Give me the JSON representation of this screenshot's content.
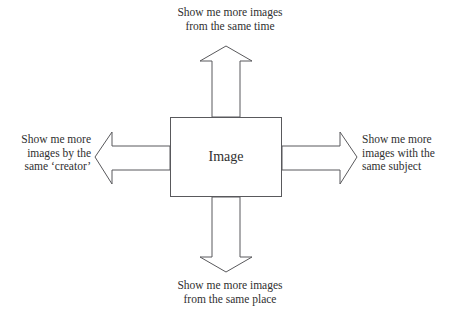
{
  "diagram": {
    "type": "radial-arrow-diagram",
    "center": {
      "label": "Image",
      "shape": "rectangle"
    },
    "branches": [
      {
        "direction": "up",
        "arrow_name": "arrow-up",
        "label": "Show me more images\nfrom the same time"
      },
      {
        "direction": "right",
        "arrow_name": "arrow-right",
        "label": "Show me more\nimages with the\nsame subject"
      },
      {
        "direction": "down",
        "arrow_name": "arrow-down",
        "label": "Show me more images\nfrom the same place"
      },
      {
        "direction": "left",
        "arrow_name": "arrow-left",
        "label": "Show me more\nimages by the\nsame ‘creator’"
      }
    ],
    "colors": {
      "background": "#ffffff",
      "stroke": "#59595c",
      "text": "#2f2f2f",
      "shape_fill": "#ffffff"
    }
  }
}
